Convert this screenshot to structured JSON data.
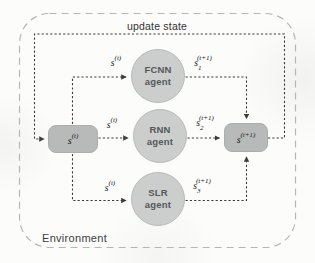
{
  "labels": {
    "update_state": "update state",
    "environment": "Environment"
  },
  "states": {
    "current": {
      "base": "s",
      "sup": "(t)"
    },
    "next": {
      "base": "s",
      "sup": "(t+1)"
    }
  },
  "agents": [
    {
      "line1": "FCNN",
      "line2": "agent"
    },
    {
      "line1": "RNN",
      "line2": "agent"
    },
    {
      "line1": "SLR",
      "line2": "agent"
    }
  ],
  "signals": {
    "input_fcnn": {
      "base": "s",
      "sup": "(t)"
    },
    "input_rnn": {
      "base": "s",
      "sup": "(t)"
    },
    "input_slr": {
      "base": "s",
      "sup": "(t)"
    },
    "output_fcnn": {
      "base": "s",
      "sub": "1",
      "sup": "(t+1)"
    },
    "output_rnn": {
      "base": "s",
      "sub": "2",
      "sup": "(t+1)"
    },
    "output_slr": {
      "base": "s",
      "sub": "3",
      "sup": "(t+1)"
    }
  },
  "colors": {
    "background": "#fcfcfa",
    "outer-border-color": "#b5b8b2",
    "line-color": "#3d3d3d",
    "box-fill": "#b7bab9",
    "box-border": "#aaaead",
    "circle-fill": "#cbcecd",
    "circle-border": "#b9bcbb",
    "circle-text": "#54585a",
    "label-color": "#333333",
    "env-label-color": "#3a3e3d",
    "math-color": "#161616"
  }
}
